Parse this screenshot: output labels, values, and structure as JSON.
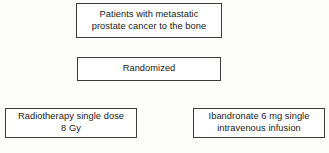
{
  "diagram": {
    "type": "flowchart",
    "colors": {
      "background": "#fdfdfc",
      "node_fill": "#ffffff",
      "node_border": "#3c3c3c",
      "text": "#1a1a1a"
    },
    "nodes": [
      {
        "id": "population",
        "role": "study-population",
        "lines": [
          "Patients with metastatic",
          "prostate cancer to the bone"
        ]
      },
      {
        "id": "randomized",
        "role": "randomization-step",
        "lines": [
          "Randomized"
        ]
      },
      {
        "id": "arm-radiotherapy",
        "role": "treatment-arm",
        "lines": [
          "Radiotherapy single dose",
          "8 Gy"
        ]
      },
      {
        "id": "arm-ibandronate",
        "role": "treatment-arm",
        "lines": [
          "Ibandronate 6 mg single",
          "intravenous infusion"
        ]
      }
    ]
  }
}
